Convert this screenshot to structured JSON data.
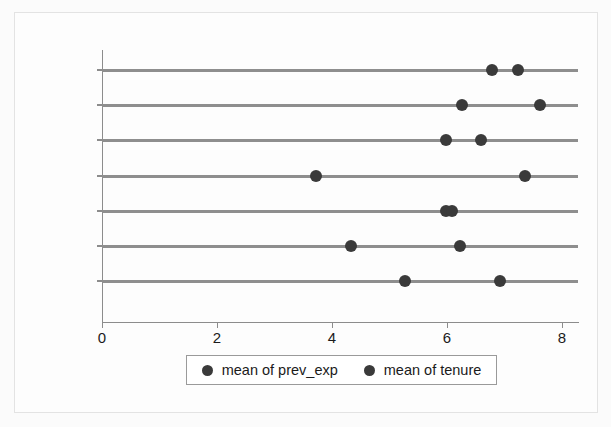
{
  "chart_data": {
    "type": "scatter",
    "title": "",
    "xlabel": "",
    "ylabel": "",
    "xlim": [
      0,
      8.3
    ],
    "xticks": [
      0,
      2,
      4,
      6,
      8
    ],
    "xtick_labels": [
      "0",
      "2",
      "4",
      "6",
      "8"
    ],
    "grid": false,
    "legend_position": "bottom",
    "categories": [
      "Prof",
      "Mgmt",
      "Sales",
      "Cler.",
      "Operat.",
      "Labor",
      "Other"
    ],
    "series": [
      {
        "name": "mean of prev_exp",
        "color": "#3a3a3a",
        "values": [
          6.78,
          6.26,
          5.98,
          3.72,
          5.98,
          4.33,
          5.27
        ]
      },
      {
        "name": "mean of tenure",
        "color": "#3a3a3a",
        "values": [
          7.23,
          7.62,
          6.59,
          7.36,
          6.08,
          6.23,
          6.92
        ]
      }
    ]
  },
  "legend": {
    "entries": [
      {
        "label": "mean of prev_exp"
      },
      {
        "label": "mean of tenure"
      }
    ]
  }
}
